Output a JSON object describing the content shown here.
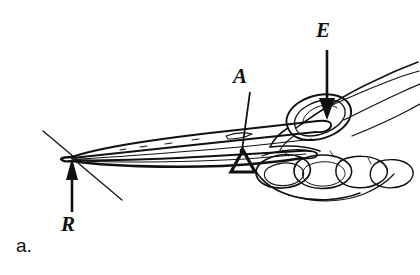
{
  "figure": {
    "domain": "line-drawing illustration",
    "caption_letter": "a.",
    "background_color": "#ffffff",
    "ink_color": "#111111",
    "width": 420,
    "height": 275
  },
  "labels": {
    "effort": {
      "text": "E",
      "meaning": "effort applied by thumb",
      "x": 326,
      "y": 33,
      "arrow": {
        "type": "straight-down-arrow",
        "from_x": 327,
        "from_y": 50,
        "to_x": 327,
        "to_y": 118,
        "head": "solid-triangle"
      }
    },
    "axis": {
      "text": "A",
      "meaning": "axis or fulcrum of the lever",
      "x": 242,
      "y": 78,
      "leader": {
        "type": "diagonal-leader-line",
        "from_x": 250,
        "from_y": 92,
        "to_x": 241,
        "to_y": 152,
        "head": "round-dot"
      },
      "fulcrum_symbol": {
        "type": "triangle",
        "cx": 243,
        "cy": 163,
        "half_width": 12,
        "height": 16
      }
    },
    "resistance": {
      "text": "R",
      "meaning": "resistance at the forceps tip",
      "x": 69,
      "y": 226,
      "arrow": {
        "type": "straight-up-arrow",
        "from_x": 72,
        "from_y": 212,
        "to_x": 72,
        "to_y": 158,
        "head": "solid-triangle"
      }
    }
  },
  "parts": {
    "forceps_upper_arm": "upper forceps blade tapering from hand to left tip",
    "forceps_lower_arm": "lower forceps blade tapering from hand to left tip",
    "forceps_tip": "converging point of both blades at left",
    "hand": "right hand with thumb on top and fingers curled beneath",
    "thumb": "thumb pad pressing down on upper forceps arm",
    "fingers": "curled index, middle, ring and little fingers supporting lower arm",
    "wrist": "wrist and back-of-hand contour extending to upper right",
    "tip_guide_lines": "two thin crossing lines marking movement at the tip"
  }
}
